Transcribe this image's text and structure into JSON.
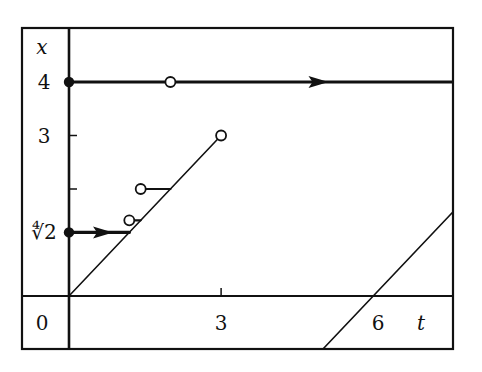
{
  "diagram": {
    "type": "phase-diagram",
    "colors": {
      "ink": "#111111",
      "background": "#ffffff"
    },
    "axes": {
      "t_label": "t",
      "x_label": "x",
      "origin_label": "0",
      "t_range": [
        -0.95,
        7.6
      ],
      "x_range": [
        -1.0,
        5.0
      ],
      "t_ticks": [
        {
          "value": 3,
          "label": "3"
        },
        {
          "value": 6,
          "label": "6"
        }
      ],
      "x_ticks": [
        {
          "value": 4,
          "label": "4"
        },
        {
          "value": 3,
          "label": "3"
        },
        {
          "value": 2,
          "label": ""
        },
        {
          "value": 1.1892,
          "label": "∜2"
        }
      ]
    },
    "trajectories": [
      {
        "name": "constant-x4",
        "from": [
          0,
          4
        ],
        "to": [
          7.6,
          4
        ],
        "weight": "bold",
        "arrow_at_t": 5.0
      },
      {
        "name": "diagonal-from-origin",
        "from": [
          0,
          0
        ],
        "to": [
          3,
          3
        ],
        "weight": "thin"
      },
      {
        "name": "arrow-from-fourth-root-2",
        "from": [
          0,
          1.1892
        ],
        "to": [
          1.1892,
          1.1892
        ],
        "weight": "bold",
        "arrow_at_t": 0.75
      },
      {
        "name": "segment-sqrt2",
        "from": [
          1.1892,
          1.4142
        ],
        "to": [
          1.4142,
          1.4142
        ],
        "weight": "medium"
      },
      {
        "name": "segment-2",
        "from": [
          1.4142,
          2
        ],
        "to": [
          2,
          2
        ],
        "weight": "medium"
      },
      {
        "name": "diagonal-shifted",
        "from": [
          5.0,
          -1.0
        ],
        "to": [
          7.6,
          1.6
        ],
        "weight": "thin"
      }
    ],
    "filled_points": [
      [
        0,
        4
      ],
      [
        0,
        1.1892
      ]
    ],
    "open_points": [
      [
        2,
        4
      ],
      [
        3,
        3
      ],
      [
        1.4142,
        2
      ],
      [
        1.1892,
        1.4142
      ]
    ]
  }
}
